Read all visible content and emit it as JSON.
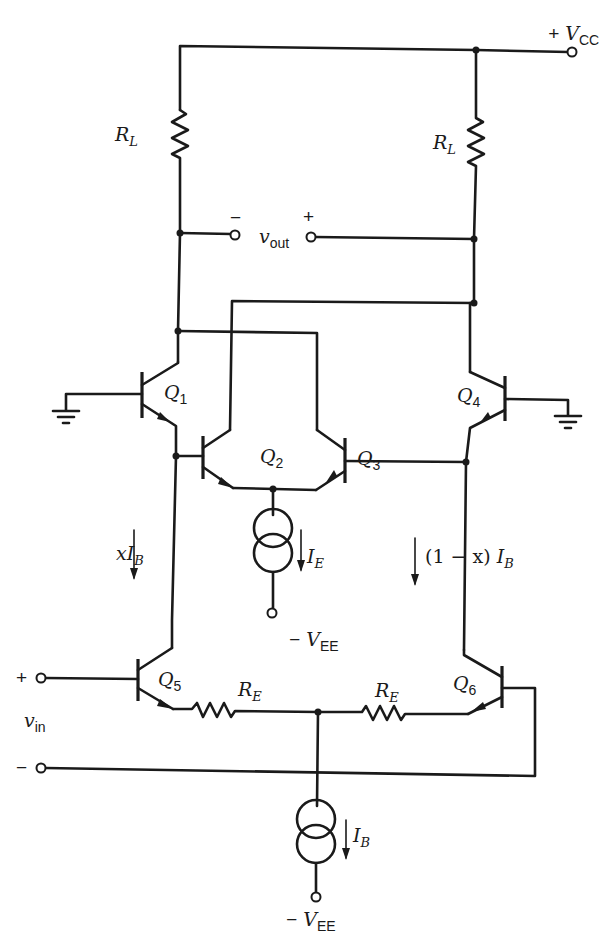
{
  "diagram": {
    "type": "circuit-schematic",
    "supplies": {
      "vcc": {
        "sign": "+",
        "symbol": "V",
        "subscript": "CC"
      },
      "vee_top": {
        "sign": "−",
        "symbol": "V",
        "subscript": "EE"
      },
      "vee_bottom": {
        "sign": "−",
        "symbol": "V",
        "subscript": "EE"
      }
    },
    "resistors": {
      "rl_left": {
        "symbol": "R",
        "subscript": "L"
      },
      "rl_right": {
        "symbol": "R",
        "subscript": "L"
      },
      "re_left": {
        "symbol": "R",
        "subscript": "E"
      },
      "re_right": {
        "symbol": "R",
        "subscript": "E"
      }
    },
    "transistors": {
      "q1": {
        "symbol": "Q",
        "subscript": "1"
      },
      "q2": {
        "symbol": "Q",
        "subscript": "2"
      },
      "q3": {
        "symbol": "Q",
        "subscript": "3"
      },
      "q4": {
        "symbol": "Q",
        "subscript": "4"
      },
      "q5": {
        "symbol": "Q",
        "subscript": "5"
      },
      "q6": {
        "symbol": "Q",
        "subscript": "6"
      }
    },
    "current_sources": {
      "ie": {
        "symbol": "I",
        "subscript": "E"
      },
      "ib": {
        "symbol": "I",
        "subscript": "B"
      }
    },
    "currents": {
      "left_branch": {
        "prefix": "x",
        "symbol": "I",
        "subscript": "B"
      },
      "right_branch": {
        "prefix": "(1 − x) ",
        "symbol": "I",
        "subscript": "B"
      }
    },
    "output": {
      "minus": "−",
      "plus": "+",
      "symbol": "v",
      "subscript": "out"
    },
    "input": {
      "plus": "+",
      "minus": "−",
      "symbol": "v",
      "subscript": "in"
    }
  }
}
